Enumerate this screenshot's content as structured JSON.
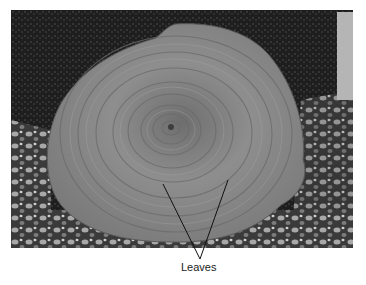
{
  "figure": {
    "labels": [
      {
        "text": "Leaves",
        "points_to": [
          "leaf-left",
          "leaf-right"
        ]
      }
    ]
  },
  "colors": {
    "background": "#ffffff",
    "rosette": "#8a8a8a",
    "soil": "#2a2a2a",
    "pebbles": "#9a9a9a",
    "leader_line": "#111111",
    "label_text": "#222222"
  }
}
